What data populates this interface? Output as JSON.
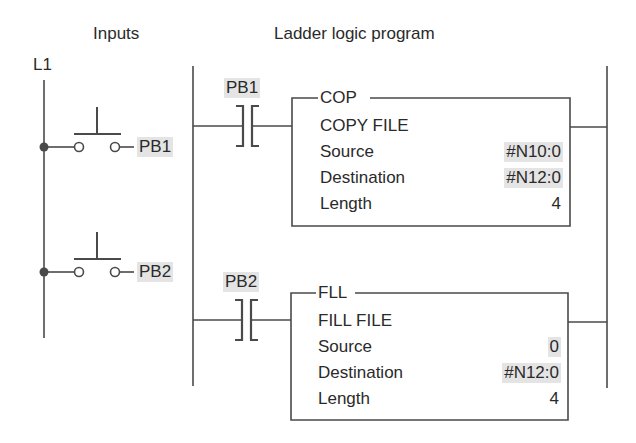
{
  "headers": {
    "inputs": "Inputs",
    "program": "Ladder logic program"
  },
  "power_line": {
    "label": "L1"
  },
  "inputs": [
    {
      "tag": "PB1",
      "type": "normally-open pushbutton"
    },
    {
      "tag": "PB2",
      "type": "normally-open pushbutton"
    }
  ],
  "rungs": [
    {
      "contact": {
        "tag": "PB1",
        "type": "examine-if-closed"
      },
      "instruction": {
        "mnemonic": "COP",
        "title": "COPY FILE",
        "params": [
          {
            "label": "Source",
            "value": "#N10:0",
            "highlight": true
          },
          {
            "label": "Destination",
            "value": "#N12:0",
            "highlight": true
          },
          {
            "label": "Length",
            "value": "4",
            "highlight": false
          }
        ]
      }
    },
    {
      "contact": {
        "tag": "PB2",
        "type": "examine-if-closed"
      },
      "instruction": {
        "mnemonic": "FLL",
        "title": "FILL FILE",
        "params": [
          {
            "label": "Source",
            "value": "0",
            "highlight": true
          },
          {
            "label": "Destination",
            "value": "#N12:0",
            "highlight": true
          },
          {
            "label": "Length",
            "value": "4",
            "highlight": false
          }
        ]
      }
    }
  ],
  "colors": {
    "line": "#4a4a4a",
    "highlight": "#e4e4e4",
    "text": "#2a2a2a"
  }
}
